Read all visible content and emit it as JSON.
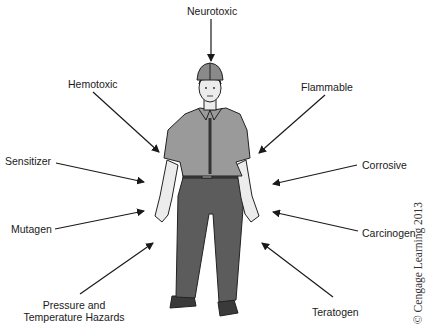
{
  "diagram": {
    "center_figure": "worker-with-hard-hat",
    "labels": {
      "neurotoxic": "Neurotoxic",
      "hemotoxic": "Hemotoxic",
      "flammable": "Flammable",
      "sensitizer": "Sensitizer",
      "corrosive": "Corrosive",
      "mutagen": "Mutagen",
      "carcinogen": "Carcinogen",
      "pressure_line1": "Pressure and",
      "pressure_line2": "Temperature Hazards",
      "teratogen": "Teratogen"
    },
    "copyright": "© Cengage Learning 2013",
    "colors": {
      "arrow": "#1a1a1a",
      "shirt": "#9a9a9a",
      "pants": "#5c5c5c",
      "skin": "#ececec",
      "helmet": "#8a8a8a",
      "shoes": "#3a3a3a"
    }
  }
}
